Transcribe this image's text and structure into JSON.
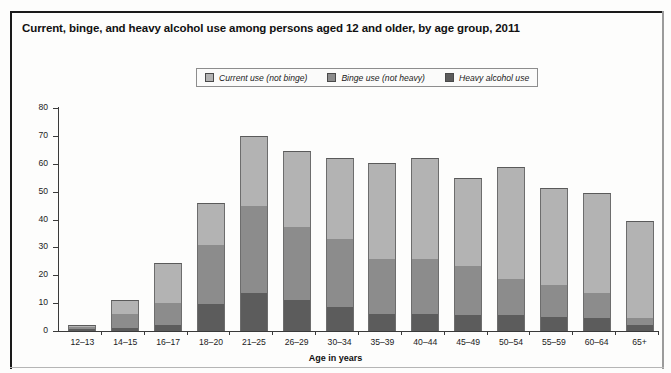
{
  "figure": {
    "title": "Current, binge, and heavy alcohol use among persons aged 12 and older, by age group, 2011"
  },
  "legend": {
    "position": "top-center",
    "items": [
      {
        "label": "Current use (not binge)",
        "color": "#b3b3b3",
        "key": "current"
      },
      {
        "label": "Binge use (not heavy)",
        "color": "#8c8c8c",
        "key": "binge"
      },
      {
        "label": "Heavy alcohol use",
        "color": "#5c5c5c",
        "key": "heavy"
      }
    ]
  },
  "chart_data": {
    "type": "bar",
    "stacked": true,
    "title": "Current, binge, and heavy alcohol use among persons aged 12 and older, by age group, 2011",
    "xlabel": "Age in years",
    "ylabel": "Percent using in past month",
    "ylim": [
      0,
      80
    ],
    "yticks": [
      0,
      10,
      20,
      30,
      40,
      50,
      60,
      70,
      80
    ],
    "grid": false,
    "categories": [
      "12–13",
      "14–15",
      "16–17",
      "18–20",
      "21–25",
      "26–29",
      "30–34",
      "35–39",
      "40–44",
      "45–49",
      "50–54",
      "55–59",
      "60–64",
      "65+"
    ],
    "series": [
      {
        "name": "Heavy alcohol use",
        "color": "#5c5c5c",
        "values": [
          0.6,
          1.1,
          2.2,
          9.8,
          13.6,
          11.2,
          8.6,
          6.0,
          6.1,
          5.8,
          5.6,
          5.0,
          4.5,
          2.0
        ]
      },
      {
        "name": "Binge use (not heavy)",
        "color": "#8c8c8c",
        "values": [
          0.9,
          5.1,
          7.8,
          21.2,
          31.2,
          26.1,
          24.4,
          20.0,
          19.7,
          17.7,
          12.9,
          11.5,
          9.0,
          2.6
        ]
      },
      {
        "name": "Current use (not binge)",
        "color": "#b3b3b3",
        "values": [
          0.7,
          4.8,
          14.5,
          15.0,
          25.2,
          27.4,
          29.0,
          34.4,
          36.2,
          31.5,
          40.2,
          34.9,
          36.1,
          34.7
        ]
      }
    ],
    "totals": [
      2.2,
      11.0,
      24.5,
      46.0,
      70.0,
      64.7,
      62.0,
      60.4,
      62.0,
      55.0,
      58.7,
      51.4,
      49.6,
      39.3
    ]
  },
  "axes": {
    "ylabel": "Percent using in past month",
    "xlabel": "Age in years",
    "ytick_labels": [
      "0",
      "10",
      "20",
      "30",
      "40",
      "50",
      "60",
      "70",
      "80"
    ]
  }
}
